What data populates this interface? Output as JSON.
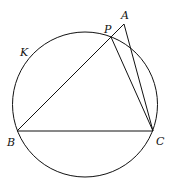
{
  "diagram": {
    "labels": {
      "A": "A",
      "P": "P",
      "K": "K",
      "B": "B",
      "C": "C"
    },
    "circle": {
      "name": "K",
      "cx": 85,
      "cy": 104.5,
      "r": 72.5
    },
    "points": {
      "A": [
        124,
        24
      ],
      "P": [
        111,
        37
      ],
      "B": [
        17,
        131
      ],
      "C": [
        153,
        131
      ]
    },
    "segments": [
      [
        "B",
        "A"
      ],
      [
        "B",
        "C"
      ],
      [
        "P",
        "C"
      ],
      [
        "A",
        "C"
      ]
    ]
  }
}
